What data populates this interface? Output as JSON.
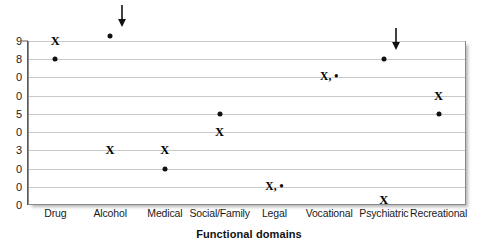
{
  "chart_data": {
    "type": "scatter",
    "title": "",
    "xlabel": "Functional domains",
    "ylabel": "",
    "categories": [
      "Drug",
      "Alcohol",
      "Medical",
      "Social/Family",
      "Legal",
      "Vocational",
      "Psychiatric",
      "Recreational"
    ],
    "ylim": [
      0,
      90
    ],
    "yticks": [
      90,
      80,
      70,
      60,
      50,
      40,
      30,
      20,
      10,
      0
    ],
    "ytick_labels": [
      "9",
      "8",
      "0",
      "0",
      "5",
      "0",
      "3",
      "0",
      "0",
      "0"
    ],
    "grid": true,
    "legend": "none",
    "series": [
      {
        "name": "X",
        "marker": "X",
        "values": [
          90,
          30,
          30,
          40,
          10,
          70,
          0,
          60
        ]
      },
      {
        "name": "dot",
        "marker": "•",
        "values": [
          80,
          93,
          20,
          50,
          10,
          70,
          80,
          50
        ]
      }
    ],
    "overlapping_labels": [
      {
        "category": "Legal",
        "value": 10,
        "text": "X, •"
      },
      {
        "category": "Vocational",
        "value": 70,
        "text": "X, •"
      }
    ],
    "annotations": [
      {
        "type": "arrow-down",
        "category": "Alcohol",
        "target_value": 93
      },
      {
        "type": "arrow-down",
        "category": "Psychiatric",
        "target_value": 80
      }
    ]
  },
  "axis": {
    "x_title": "Functional domains"
  }
}
